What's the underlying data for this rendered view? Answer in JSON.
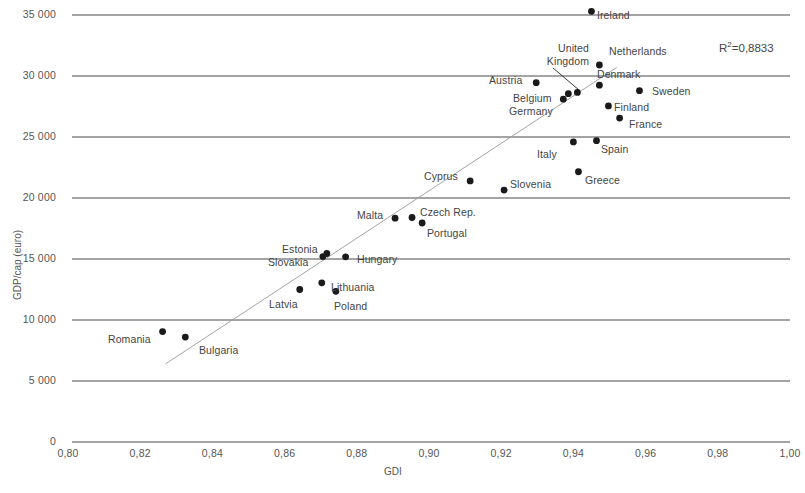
{
  "chart_data": {
    "type": "scatter",
    "title": "",
    "xlabel": "GDI",
    "ylabel": "GDP/cap (euro)",
    "xlim": [
      0.8,
      1.0
    ],
    "ylim": [
      0,
      35000
    ],
    "xticks": [
      "0,80",
      "0,82",
      "0,84",
      "0,86",
      "0,88",
      "0,90",
      "0,92",
      "0,94",
      "0,96",
      "0,98",
      "1,00"
    ],
    "xtick_values": [
      0.8,
      0.82,
      0.84,
      0.86,
      0.88,
      0.9,
      0.92,
      0.94,
      0.96,
      0.98,
      1.0
    ],
    "yticks": [
      "0",
      "5 000",
      "10 000",
      "15 000",
      "20 000",
      "25 000",
      "30 000",
      "35 000"
    ],
    "ytick_values": [
      0,
      5000,
      10000,
      15000,
      20000,
      25000,
      30000,
      35000
    ],
    "grid": "horizontal",
    "legend": "none",
    "trendline": {
      "type": "linear",
      "x0": 0.827,
      "y0": 6400,
      "x1": 0.952,
      "y1": 30700
    },
    "annotations": [
      {
        "name": "r-squared",
        "text": "R2=0,8833",
        "display": "R²=0,8833"
      }
    ],
    "points": [
      {
        "label": "Romania",
        "x": 0.8262,
        "y": 9050,
        "lx": 108,
        "ly": 333,
        "anchor": "right"
      },
      {
        "label": "Bulgaria",
        "x": 0.8325,
        "y": 8600,
        "lx": 199,
        "ly": 344,
        "anchor": "left"
      },
      {
        "label": "Latvia",
        "x": 0.8642,
        "y": 12500,
        "lx": 269,
        "ly": 298,
        "anchor": "left"
      },
      {
        "label": "Lithuania",
        "x": 0.8703,
        "y": 13050,
        "lx": 331,
        "ly": 281,
        "anchor": "left"
      },
      {
        "label": "Poland",
        "x": 0.8742,
        "y": 12350,
        "lx": 334,
        "ly": 300,
        "anchor": "left"
      },
      {
        "label": "Estonia",
        "x": 0.8717,
        "y": 15450,
        "lx": 282,
        "ly": 243,
        "anchor": "left"
      },
      {
        "label": "Slovakia",
        "x": 0.8706,
        "y": 15200,
        "lx": 268,
        "ly": 256,
        "anchor": "left"
      },
      {
        "label": "Hungary",
        "x": 0.8769,
        "y": 15180,
        "lx": 357,
        "ly": 253,
        "anchor": "left"
      },
      {
        "label": "Malta",
        "x": 0.8906,
        "y": 18350,
        "lx": 357,
        "ly": 209,
        "anchor": "right"
      },
      {
        "label": "Czech Rep.",
        "x": 0.8953,
        "y": 18400,
        "lx": 420,
        "ly": 206,
        "anchor": "left"
      },
      {
        "label": "Portugal",
        "x": 0.8981,
        "y": 17950,
        "lx": 427,
        "ly": 227,
        "anchor": "left"
      },
      {
        "label": "Cyprus",
        "x": 0.9114,
        "y": 21400,
        "lx": 424,
        "ly": 170,
        "anchor": "right"
      },
      {
        "label": "Slovenia",
        "x": 0.9208,
        "y": 20650,
        "lx": 510,
        "ly": 178,
        "anchor": "left"
      },
      {
        "label": "Italy",
        "x": 0.94,
        "y": 24600,
        "lx": 537,
        "ly": 148,
        "anchor": "right"
      },
      {
        "label": "Spain",
        "x": 0.9464,
        "y": 24700,
        "lx": 601,
        "ly": 143,
        "anchor": "left"
      },
      {
        "label": "Greece",
        "x": 0.9414,
        "y": 22150,
        "lx": 585,
        "ly": 174,
        "anchor": "left"
      },
      {
        "label": "Germany",
        "x": 0.9372,
        "y": 28100,
        "lx": 509,
        "ly": 105,
        "anchor": "right"
      },
      {
        "label": "Belgium",
        "x": 0.9386,
        "y": 28550,
        "lx": 513,
        "ly": 92,
        "anchor": "right"
      },
      {
        "label": "United Kingdom",
        "x": 0.9411,
        "y": 28650,
        "lx": 533,
        "ly": 42,
        "anchor": "left",
        "multiline": true
      },
      {
        "label": "Austria",
        "x": 0.9297,
        "y": 29450,
        "lx": 489,
        "ly": 74,
        "anchor": "right"
      },
      {
        "label": "Denmark",
        "x": 0.9472,
        "y": 29250,
        "lx": 597,
        "ly": 68,
        "anchor": "left"
      },
      {
        "label": "Netherlands",
        "x": 0.9472,
        "y": 30900,
        "lx": 609,
        "ly": 45,
        "anchor": "left"
      },
      {
        "label": "Sweden",
        "x": 0.9583,
        "y": 28800,
        "lx": 652,
        "ly": 85,
        "anchor": "left"
      },
      {
        "label": "Finland",
        "x": 0.9497,
        "y": 27550,
        "lx": 614,
        "ly": 101,
        "anchor": "left"
      },
      {
        "label": "France",
        "x": 0.9528,
        "y": 26550,
        "lx": 629,
        "ly": 118,
        "anchor": "left"
      },
      {
        "label": "Ireland",
        "x": 0.945,
        "y": 35300,
        "lx": 597,
        "ly": 9,
        "anchor": "left"
      }
    ]
  },
  "labels": {
    "uk_line1": "United",
    "uk_line2": "Kingdom"
  }
}
